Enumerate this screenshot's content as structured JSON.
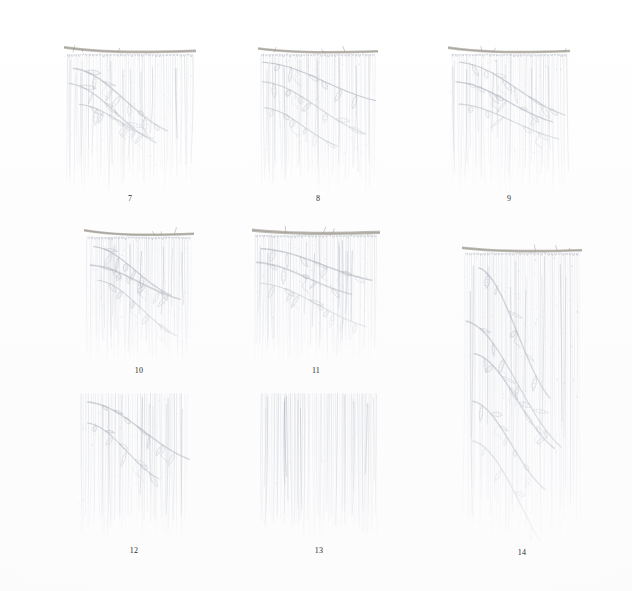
{
  "plate": {
    "medium": "macrame wall hangings photographic plate",
    "background_color": "#ffffff",
    "ink_color": "#9aa0ab",
    "caption_color": "#2b2b2b",
    "dowel_color": "#8b8578",
    "figure_count": 8
  },
  "figures": [
    {
      "number": "7",
      "label": "7",
      "row": 1,
      "column": 1,
      "x": 64,
      "y": 40,
      "w": 132,
      "h": 152,
      "caption_y": 194,
      "style": "wide-hanging",
      "has_dowel": true,
      "dowel_type": "natural branch",
      "cord_count": 58,
      "motif": "diagonal branch with leaves, left to right descending",
      "fringe_depth": 0.55,
      "density": 0.55
    },
    {
      "number": "8",
      "label": "8",
      "row": 1,
      "column": 2,
      "x": 258,
      "y": 40,
      "w": 120,
      "h": 152,
      "caption_y": 194,
      "style": "wide-hanging",
      "has_dowel": true,
      "dowel_type": "natural branch",
      "cord_count": 54,
      "motif": "diagonal branch with leaves and buds",
      "fringe_depth": 0.5,
      "density": 0.62
    },
    {
      "number": "9",
      "label": "9",
      "row": 1,
      "column": 3,
      "x": 448,
      "y": 40,
      "w": 122,
      "h": 152,
      "caption_y": 194,
      "style": "wide-hanging",
      "has_dowel": true,
      "dowel_type": "natural branch",
      "cord_count": 55,
      "motif": "diagonal branch with dense leaf clusters",
      "fringe_depth": 0.5,
      "density": 0.66
    },
    {
      "number": "10",
      "label": "10",
      "row": 2,
      "column": 1,
      "x": 84,
      "y": 224,
      "w": 110,
      "h": 140,
      "caption_y": 366,
      "style": "close-up",
      "has_dowel": true,
      "dowel_type": "cord header",
      "cord_count": 50,
      "motif": "branch with leaves, detail view",
      "fringe_depth": 0.35,
      "density": 0.7
    },
    {
      "number": "11",
      "label": "11",
      "row": 2,
      "column": 2,
      "x": 252,
      "y": 222,
      "w": 128,
      "h": 142,
      "caption_y": 366,
      "style": "close-up",
      "has_dowel": true,
      "dowel_type": "cord header",
      "cord_count": 56,
      "motif": "branch with leaves and tendrils, detail view",
      "fringe_depth": 0.35,
      "density": 0.72
    },
    {
      "number": "12",
      "label": "12",
      "row": 3,
      "column": 1,
      "x": 78,
      "y": 392,
      "w": 112,
      "h": 148,
      "caption_y": 546,
      "style": "detail",
      "has_dowel": false,
      "dowel_type": "none",
      "cord_count": 44,
      "motif": "single leafy branch over vertical cords",
      "fringe_depth": 0.2,
      "density": 0.45
    },
    {
      "number": "13",
      "label": "13",
      "row": 3,
      "column": 2,
      "x": 258,
      "y": 392,
      "w": 122,
      "h": 148,
      "caption_y": 546,
      "style": "detail",
      "has_dowel": false,
      "dowel_type": "none",
      "cord_count": 60,
      "motif": "plain vertical cords and fringe texture",
      "fringe_depth": 0.05,
      "density": 0.18
    },
    {
      "number": "14",
      "label": "14",
      "row": 2,
      "column": 3,
      "x": 462,
      "y": 222,
      "w": 120,
      "h": 320,
      "caption_y": 548,
      "style": "full-length",
      "has_dowel": true,
      "dowel_type": "natural branch",
      "cord_count": 52,
      "motif": "full wall hanging, cascading branch with leaves over long fringe",
      "fringe_depth": 0.62,
      "density": 0.6
    }
  ]
}
